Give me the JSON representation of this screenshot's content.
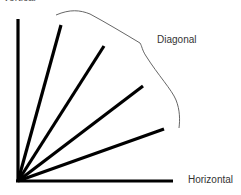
{
  "diagram": {
    "labels": {
      "top_cut": "Vertical",
      "diagonal": "Diagonal",
      "horizontal": "Horizontal"
    },
    "origin": [
      18,
      181
    ],
    "lines": [
      {
        "name": "vertical",
        "x2": 18,
        "y2": 19
      },
      {
        "name": "diagonal-1",
        "x2": 61,
        "y2": 25
      },
      {
        "name": "diagonal-2",
        "x2": 104,
        "y2": 46
      },
      {
        "name": "diagonal-3",
        "x2": 143,
        "y2": 86
      },
      {
        "name": "diagonal-4",
        "x2": 164,
        "y2": 129
      },
      {
        "name": "horizontal",
        "x2": 173,
        "y2": 181
      }
    ],
    "colors": {
      "line": "#000000",
      "brace": "#555555",
      "text": "#333333"
    }
  }
}
